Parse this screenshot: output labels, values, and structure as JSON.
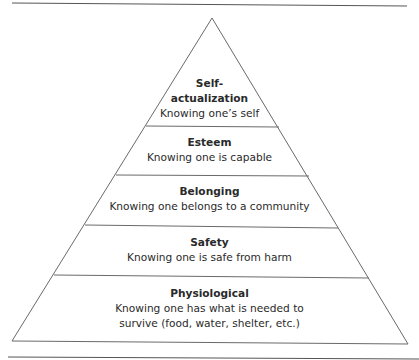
{
  "diagram": {
    "type": "pyramid",
    "levels": [
      {
        "title": "Self-",
        "title2": "actualization",
        "description": "Knowing one’s self"
      },
      {
        "title": "Esteem",
        "description": "Knowing one is capable"
      },
      {
        "title": "Belonging",
        "description": "Knowing one belongs to a community"
      },
      {
        "title": "Safety",
        "description": "Knowing one is safe from harm"
      },
      {
        "title": "Physiological",
        "description": "Knowing one has what is needed to",
        "description2": "survive (food, water, shelter, etc.)"
      }
    ]
  }
}
